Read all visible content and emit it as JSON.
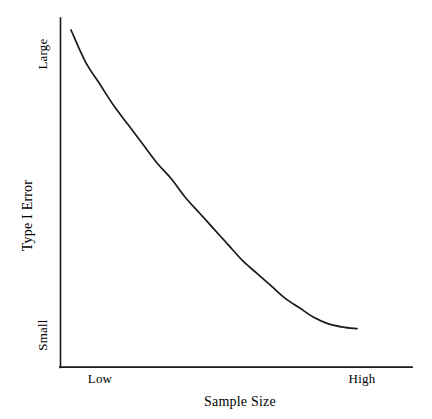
{
  "chart_data": {
    "type": "line",
    "title": "",
    "xlabel": "Sample Size",
    "ylabel": "Type I Error",
    "grid": false,
    "legend": false,
    "x_tick_labels": [
      "Low",
      "High"
    ],
    "y_tick_labels": [
      "Small",
      "Large"
    ],
    "xlim": [
      "Low",
      "High"
    ],
    "ylim": [
      "Small",
      "Large"
    ],
    "series": [
      {
        "name": "Type I Error vs Sample Size",
        "description": "Monotonically decreasing convex curve: Type I Error falls from Large at Low sample size toward Small at High sample size, flattening out.",
        "color": "#1a1a1a",
        "x": [
          0.0,
          0.05,
          0.1,
          0.15,
          0.2,
          0.25,
          0.3,
          0.35,
          0.4,
          0.45,
          0.5,
          0.55,
          0.6,
          0.65,
          0.7,
          0.75,
          0.8,
          0.85,
          0.9,
          0.95,
          1.0
        ],
        "y": [
          1.0,
          0.9,
          0.83,
          0.76,
          0.7,
          0.64,
          0.58,
          0.53,
          0.47,
          0.42,
          0.37,
          0.32,
          0.27,
          0.23,
          0.19,
          0.15,
          0.12,
          0.09,
          0.07,
          0.06,
          0.055
        ]
      }
    ]
  },
  "axes": {
    "y_top_label": "Large",
    "y_bottom_label": "Small",
    "y_title": "Type I Error",
    "x_left_label": "Low",
    "x_right_label": "High",
    "x_title": "Sample Size"
  },
  "colors": {
    "background": "#ffffff",
    "ink": "#111111",
    "curve": "#1a1a1a",
    "axis": "#1a1a1a"
  }
}
